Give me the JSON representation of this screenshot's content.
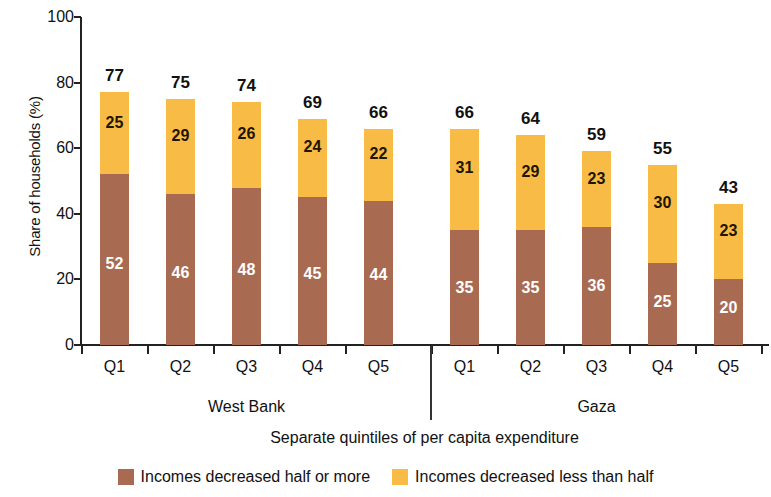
{
  "chart_data": {
    "type": "bar",
    "subtype": "stacked-bar-grouped",
    "title": "",
    "xlabel": "Separate quintiles of per capita expenditure",
    "ylabel": "Share of households (%)",
    "ylim": [
      0,
      100
    ],
    "yticks": [
      0,
      20,
      40,
      60,
      80,
      100
    ],
    "grid": false,
    "legend_position": "bottom-center",
    "groups": [
      {
        "name": "West Bank",
        "categories": [
          "Q1",
          "Q2",
          "Q3",
          "Q4",
          "Q5"
        ]
      },
      {
        "name": "Gaza",
        "categories": [
          "Q1",
          "Q2",
          "Q3",
          "Q4",
          "Q5"
        ]
      }
    ],
    "categories": [
      "Q1",
      "Q2",
      "Q3",
      "Q4",
      "Q5",
      "Q1",
      "Q2",
      "Q3",
      "Q4",
      "Q5"
    ],
    "series": [
      {
        "name": "Incomes decreased half or more",
        "color": "#a96a52",
        "values": [
          52,
          46,
          48,
          45,
          44,
          35,
          35,
          36,
          25,
          20
        ]
      },
      {
        "name": "Incomes decreased less than half",
        "color": "#f8bc46",
        "values": [
          25,
          29,
          26,
          24,
          22,
          31,
          29,
          23,
          30,
          23
        ]
      }
    ],
    "totals": [
      77,
      75,
      74,
      69,
      66,
      66,
      64,
      59,
      55,
      43
    ],
    "bars": [
      {
        "group": "West Bank",
        "category": "Q1",
        "bottom": 52,
        "top": 25,
        "total": 77
      },
      {
        "group": "West Bank",
        "category": "Q2",
        "bottom": 46,
        "top": 29,
        "total": 75
      },
      {
        "group": "West Bank",
        "category": "Q3",
        "bottom": 48,
        "top": 26,
        "total": 74
      },
      {
        "group": "West Bank",
        "category": "Q4",
        "bottom": 45,
        "top": 24,
        "total": 69
      },
      {
        "group": "West Bank",
        "category": "Q5",
        "bottom": 44,
        "top": 22,
        "total": 66
      },
      {
        "group": "Gaza",
        "category": "Q1",
        "bottom": 35,
        "top": 31,
        "total": 66
      },
      {
        "group": "Gaza",
        "category": "Q2",
        "bottom": 35,
        "top": 29,
        "total": 64
      },
      {
        "group": "Gaza",
        "category": "Q3",
        "bottom": 36,
        "top": 23,
        "total": 59
      },
      {
        "group": "Gaza",
        "category": "Q4",
        "bottom": 25,
        "top": 30,
        "total": 55
      },
      {
        "group": "Gaza",
        "category": "Q5",
        "bottom": 20,
        "top": 23,
        "total": 43
      }
    ]
  },
  "axis": {
    "y_title": "Share of households (%)",
    "x_title": "Separate quintiles of per capita expenditure",
    "y_tick_labels": [
      "100",
      "80",
      "60",
      "40",
      "20",
      "0"
    ],
    "x_tick_labels": [
      "Q1",
      "Q2",
      "Q3",
      "Q4",
      "Q5",
      "Q1",
      "Q2",
      "Q3",
      "Q4",
      "Q5"
    ],
    "group_labels": [
      "West Bank",
      "Gaza"
    ]
  },
  "legend": {
    "items": [
      {
        "label": "Incomes decreased half or more",
        "color": "#a96a52"
      },
      {
        "label": "Incomes decreased less than half",
        "color": "#f8bc46"
      }
    ]
  },
  "colors": {
    "series_bottom": "#a96a52",
    "series_top": "#f8bc46",
    "axis": "#222222",
    "text": "#111111",
    "label_on_dark": "#ffffff",
    "background": "#ffffff"
  }
}
